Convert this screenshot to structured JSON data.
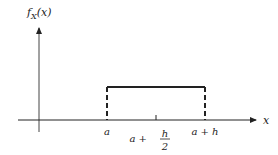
{
  "diagram": {
    "type": "uniform-density-plot",
    "y_axis_label": {
      "main": "f",
      "sub": "X",
      "arg": "(x)"
    },
    "x_axis_label": "x",
    "x_ticks": [
      {
        "label": "a"
      },
      {
        "label_prefix": "a +",
        "frac_num": "h",
        "frac_den": "2"
      },
      {
        "label": "a + h"
      }
    ],
    "colors": {
      "line": "#222222",
      "background": "#ffffff"
    }
  }
}
